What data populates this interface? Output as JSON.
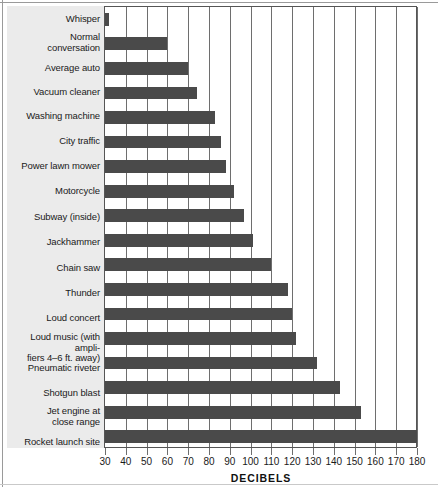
{
  "chart_data": {
    "type": "bar",
    "orientation": "horizontal",
    "title": "",
    "xlabel": "DECIBELS",
    "ylabel": "",
    "xlim": [
      30,
      180
    ],
    "xticks": [
      30,
      40,
      50,
      60,
      70,
      80,
      90,
      100,
      110,
      120,
      130,
      140,
      150,
      160,
      170,
      180
    ],
    "grid": true,
    "legend": false,
    "bar_color": "#4a4a4a",
    "panel_color": "#ebebeb",
    "categories": [
      "Whisper",
      "Normal conversation",
      "Average auto",
      "Vacuum cleaner",
      "Washing machine",
      "City traffic",
      "Power lawn mower",
      "Motorcycle",
      "Subway (inside)",
      "Jackhammer",
      "Chain saw",
      "Thunder",
      "Loud concert",
      "Loud music (with amplifiers 4–6 ft. away)",
      "Pneumatic riveter",
      "Shotgun blast",
      "Jet engine at close range",
      "Rocket launch site"
    ],
    "values": [
      32,
      60,
      70,
      74,
      83,
      86,
      88,
      92,
      97,
      101,
      110,
      118,
      120,
      122,
      132,
      143,
      153,
      180
    ]
  },
  "labels": {
    "whisper": "Whisper",
    "normal_conversation_l1": "Normal",
    "normal_conversation_l2": "conversation",
    "average_auto": "Average auto",
    "vacuum_cleaner": "Vacuum cleaner",
    "washing_machine": "Washing machine",
    "city_traffic": "City traffic",
    "power_lawn_mower": "Power lawn mower",
    "motorcycle": "Motorcycle",
    "subway_inside": "Subway (inside)",
    "jackhammer": "Jackhammer",
    "chain_saw": "Chain saw",
    "thunder": "Thunder",
    "loud_concert": "Loud concert",
    "loud_music_l1": "Loud music (with ampli-",
    "loud_music_l2": "fiers 4–6 ft. away)",
    "pneumatic_riveter": "Pneumatic riveter",
    "shotgun_blast": "Shotgun blast",
    "jet_engine_l1": "Jet engine at",
    "jet_engine_l2": "close range",
    "rocket_launch_site": "Rocket launch site"
  },
  "axis": {
    "title": "DECIBELS",
    "ticks": [
      "30",
      "40",
      "50",
      "60",
      "70",
      "80",
      "90",
      "100",
      "110",
      "120",
      "130",
      "140",
      "150",
      "160",
      "170",
      "180"
    ]
  }
}
